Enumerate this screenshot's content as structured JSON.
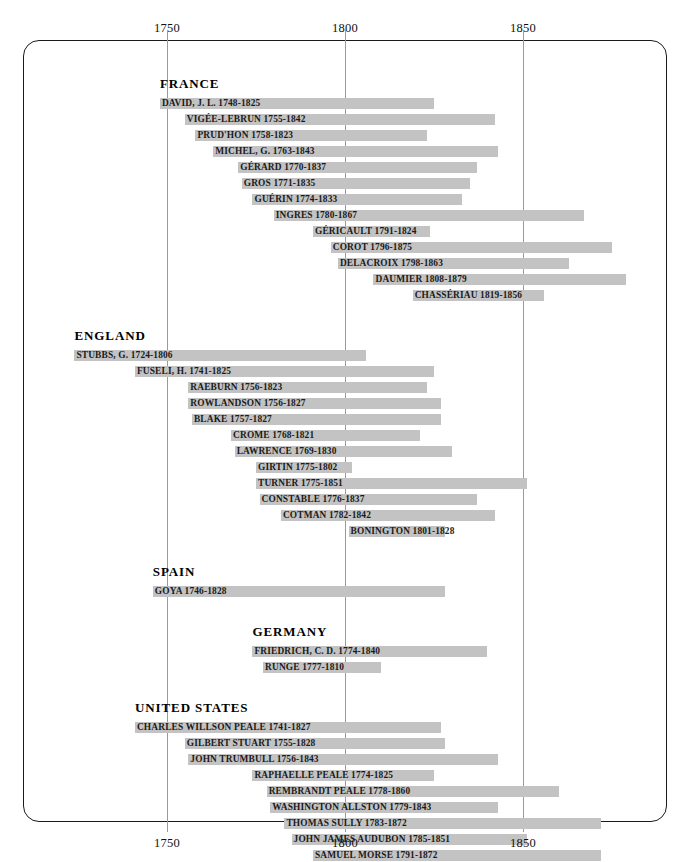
{
  "chart_data": {
    "type": "bar",
    "orientation": "horizontal-timeline",
    "title": "",
    "subtitle": "",
    "xlabel": "",
    "ylabel": "",
    "xlim": [
      1715,
      1890
    ],
    "grid": true,
    "legend": null,
    "axis_ticks": [
      {
        "label": "1750",
        "value": 1750
      },
      {
        "label": "1800",
        "value": 1800
      },
      {
        "label": "1850",
        "value": 1850
      }
    ],
    "axis_positions": [
      "top",
      "bottom"
    ],
    "colors": {
      "bar": "#c3c3c3",
      "gridline": "#9a9a9a",
      "frame": "#1a1a1a",
      "text": "#1a1a1a"
    },
    "groups": [
      {
        "name": "FRANCE",
        "artists": [
          {
            "label": "DAVID, J. L. 1748-1825",
            "name": "DAVID, J. L.",
            "birth": 1748,
            "death": 1825
          },
          {
            "label": "VIGÉE-LEBRUN 1755-1842",
            "name": "VIGÉE-LEBRUN",
            "birth": 1755,
            "death": 1842
          },
          {
            "label": "PRUD'HON 1758-1823",
            "name": "PRUD'HON",
            "birth": 1758,
            "death": 1823
          },
          {
            "label": "MICHEL, G. 1763-1843",
            "name": "MICHEL, G.",
            "birth": 1763,
            "death": 1843
          },
          {
            "label": "GÉRARD 1770-1837",
            "name": "GÉRARD",
            "birth": 1770,
            "death": 1837
          },
          {
            "label": "GROS 1771-1835",
            "name": "GROS",
            "birth": 1771,
            "death": 1835
          },
          {
            "label": "GUÉRIN 1774-1833",
            "name": "GUÉRIN",
            "birth": 1774,
            "death": 1833
          },
          {
            "label": "INGRES 1780-1867",
            "name": "INGRES",
            "birth": 1780,
            "death": 1867
          },
          {
            "label": "GÉRICAULT 1791-1824",
            "name": "GÉRICAULT",
            "birth": 1791,
            "death": 1824
          },
          {
            "label": "COROT 1796-1875",
            "name": "COROT",
            "birth": 1796,
            "death": 1875
          },
          {
            "label": "DELACROIX 1798-1863",
            "name": "DELACROIX",
            "birth": 1798,
            "death": 1863
          },
          {
            "label": "DAUMIER 1808-1879",
            "name": "DAUMIER",
            "birth": 1808,
            "death": 1879
          },
          {
            "label": "CHASSÉRIAU 1819-1856",
            "name": "CHASSÉRIAU",
            "birth": 1819,
            "death": 1856
          }
        ]
      },
      {
        "name": "ENGLAND",
        "artists": [
          {
            "label": "STUBBS, G. 1724-1806",
            "name": "STUBBS, G.",
            "birth": 1724,
            "death": 1806
          },
          {
            "label": "FUSELI, H. 1741-1825",
            "name": "FUSELI, H.",
            "birth": 1741,
            "death": 1825
          },
          {
            "label": "RAEBURN 1756-1823",
            "name": "RAEBURN",
            "birth": 1756,
            "death": 1823
          },
          {
            "label": "ROWLANDSON 1756-1827",
            "name": "ROWLANDSON",
            "birth": 1756,
            "death": 1827
          },
          {
            "label": "BLAKE 1757-1827",
            "name": "BLAKE",
            "birth": 1757,
            "death": 1827
          },
          {
            "label": "CROME 1768-1821",
            "name": "CROME",
            "birth": 1768,
            "death": 1821
          },
          {
            "label": "LAWRENCE 1769-1830",
            "name": "LAWRENCE",
            "birth": 1769,
            "death": 1830
          },
          {
            "label": "GIRTIN 1775-1802",
            "name": "GIRTIN",
            "birth": 1775,
            "death": 1802
          },
          {
            "label": "TURNER 1775-1851",
            "name": "TURNER",
            "birth": 1775,
            "death": 1851
          },
          {
            "label": "CONSTABLE 1776-1837",
            "name": "CONSTABLE",
            "birth": 1776,
            "death": 1837
          },
          {
            "label": "COTMAN 1782-1842",
            "name": "COTMAN",
            "birth": 1782,
            "death": 1842
          },
          {
            "label": "BONINGTON 1801-1828",
            "name": "BONINGTON",
            "birth": 1801,
            "death": 1828
          }
        ]
      },
      {
        "name": "SPAIN",
        "artists": [
          {
            "label": "GOYA 1746-1828",
            "name": "GOYA",
            "birth": 1746,
            "death": 1828
          }
        ]
      },
      {
        "name": "GERMANY",
        "artists": [
          {
            "label": "FRIEDRICH, C. D. 1774-1840",
            "name": "FRIEDRICH, C. D.",
            "birth": 1774,
            "death": 1840
          },
          {
            "label": "RUNGE 1777-1810",
            "name": "RUNGE",
            "birth": 1777,
            "death": 1810
          }
        ]
      },
      {
        "name": "UNITED STATES",
        "artists": [
          {
            "label": "CHARLES WILLSON PEALE 1741-1827",
            "name": "CHARLES WILLSON PEALE",
            "birth": 1741,
            "death": 1827
          },
          {
            "label": "GILBERT STUART 1755-1828",
            "name": "GILBERT STUART",
            "birth": 1755,
            "death": 1828
          },
          {
            "label": "JOHN TRUMBULL 1756-1843",
            "name": "JOHN TRUMBULL",
            "birth": 1756,
            "death": 1843
          },
          {
            "label": "RAPHAELLE PEALE 1774-1825",
            "name": "RAPHAELLE PEALE",
            "birth": 1774,
            "death": 1825
          },
          {
            "label": "REMBRANDT PEALE 1778-1860",
            "name": "REMBRANDT PEALE",
            "birth": 1778,
            "death": 1860
          },
          {
            "label": "WASHINGTON ALLSTON 1779-1843",
            "name": "WASHINGTON ALLSTON",
            "birth": 1779,
            "death": 1843
          },
          {
            "label": "THOMAS SULLY 1783-1872",
            "name": "THOMAS SULLY",
            "birth": 1783,
            "death": 1872
          },
          {
            "label": "JOHN JAMES AUDUBON 1785-1851",
            "name": "JOHN JAMES AUDUBON",
            "birth": 1785,
            "death": 1851
          },
          {
            "label": "SAMUEL MORSE 1791-1872",
            "name": "SAMUEL MORSE",
            "birth": 1791,
            "death": 1872
          },
          {
            "label": "GEORGE CATLIN 1796-1872",
            "name": "GEORGE CATLIN",
            "birth": 1796,
            "death": 1872
          },
          {
            "label": "THOMAS COLE 1801-1848",
            "name": "THOMAS COLE",
            "birth": 1801,
            "death": 1848
          }
        ]
      }
    ]
  },
  "layout": {
    "row_height": 16,
    "group_gap": 22,
    "group_title_height": 22,
    "first_row_top": 76,
    "px_per_year": 3.56,
    "year_origin": 1800,
    "x_origin_px": 345
  }
}
